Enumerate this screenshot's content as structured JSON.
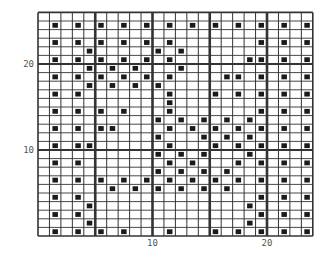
{
  "chart_data": {
    "type": "heatmap",
    "title": "",
    "columns": 24,
    "rows": 26,
    "thick_line_every": 5,
    "x_tick_labels": [
      {
        "col": 10,
        "label": "10"
      },
      {
        "col": 20,
        "label": "20"
      }
    ],
    "y_tick_labels": [
      {
        "row": 10,
        "label": "10"
      },
      {
        "row": 20,
        "label": "20"
      }
    ],
    "row_numbering": "bottom-up",
    "filled_color": "#1a1a1a",
    "grid_color": "#333333",
    "filled_cells_by_row": {
      "1": [
        2,
        4,
        6,
        8,
        12,
        16,
        18,
        20,
        22,
        24
      ],
      "2": [
        5,
        19
      ],
      "3": [
        2,
        4,
        20,
        22,
        24
      ],
      "4": [
        5,
        19
      ],
      "5": [
        2,
        4,
        20,
        22,
        24
      ],
      "6": [
        7,
        9,
        11,
        13,
        15,
        17
      ],
      "7": [
        2,
        4,
        6,
        8,
        10,
        12,
        14,
        16,
        18,
        20,
        22,
        24
      ],
      "8": [
        11,
        13,
        15,
        17
      ],
      "9": [
        2,
        4,
        12,
        14,
        18,
        20,
        22,
        24
      ],
      "10": [
        11,
        13,
        15,
        19
      ],
      "11": [
        2,
        4,
        5,
        12,
        16,
        18,
        20,
        22,
        24
      ],
      "12": [
        11,
        15,
        17,
        19
      ],
      "13": [
        2,
        4,
        6,
        7,
        12,
        14,
        16,
        18,
        20,
        22,
        24
      ],
      "14": [
        11,
        13,
        15,
        17,
        19
      ],
      "15": [
        2,
        4,
        6,
        8,
        12,
        20,
        22,
        24
      ],
      "16": [
        12
      ],
      "17": [
        2,
        4,
        12,
        16,
        18,
        20,
        22,
        24
      ],
      "18": [
        5,
        7,
        9,
        11
      ],
      "19": [
        2,
        4,
        6,
        8,
        10,
        12,
        17,
        18,
        20,
        22,
        24
      ],
      "20": [
        5,
        7,
        9,
        13
      ],
      "21": [
        2,
        4,
        6,
        8,
        10,
        12,
        19,
        20,
        22,
        24
      ],
      "22": [
        5,
        11,
        13
      ],
      "23": [
        2,
        4,
        6,
        8,
        10,
        12,
        20,
        22,
        24
      ],
      "24": [],
      "25": [
        2,
        4,
        6,
        8,
        10,
        12,
        14,
        16,
        18,
        20,
        22,
        24
      ],
      "26": []
    }
  }
}
